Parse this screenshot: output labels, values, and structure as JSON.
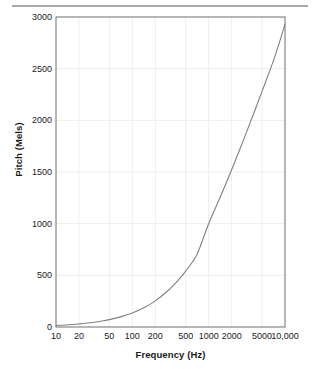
{
  "figure": {
    "top_rule": "horizontal-rule",
    "background_color": "#ffffff",
    "plot_border_color": "#6e6e6e",
    "grid_color": "#eeeeee",
    "curve_color": "#808080",
    "text_color": "#1a1a1a"
  },
  "chart_data": {
    "type": "line",
    "title": "",
    "subtitle": "",
    "xlabel": "Frequency (Hz)",
    "ylabel": "Pitch (Mels)",
    "xscale": "log",
    "yscale": "linear",
    "xlim": [
      10,
      10000
    ],
    "ylim": [
      0,
      3000
    ],
    "grid": true,
    "legend": null,
    "xticks": [
      10,
      20,
      50,
      100,
      200,
      500,
      1000,
      2000,
      5000,
      10000
    ],
    "xticklabels": [
      "10",
      "20",
      "50",
      "100",
      "200",
      "500",
      "1000",
      "2000",
      "5000",
      "10,000"
    ],
    "yticks": [
      0,
      500,
      1000,
      1500,
      2000,
      2500,
      3000
    ],
    "yticklabels": [
      "0",
      "500",
      "1000",
      "1500",
      "2000",
      "2500",
      "3000"
    ],
    "series": [
      {
        "name": "Mel scale",
        "color": "#808080",
        "x": [
          10,
          15,
          20,
          30,
          40,
          50,
          70,
          100,
          150,
          200,
          300,
          400,
          500,
          700,
          1000,
          1500,
          2000,
          3000,
          4000,
          5000,
          7000,
          8500,
          10000
        ],
        "y": [
          15,
          22,
          30,
          44,
          58,
          71,
          98,
          136,
          196,
          253,
          358,
          453,
          541,
          700,
          1000,
          1300,
          1521,
          1850,
          2090,
          2280,
          2570,
          2760,
          2930
        ]
      }
    ]
  }
}
